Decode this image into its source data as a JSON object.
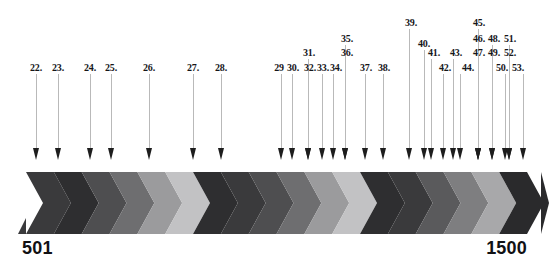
{
  "figure": {
    "width": 549,
    "height": 267,
    "background": "#ffffff"
  },
  "range": {
    "start_label": "501",
    "end_label": "1500"
  },
  "style": {
    "leader_color": "#b9b9b9",
    "arrowhead_color": "#1d1d1d",
    "label_color": "#16161a",
    "range_number_color": "#111114"
  },
  "callouts": [
    {
      "label": "22.",
      "x": 36,
      "label_x": 36,
      "label_y": 62,
      "head_y": 148
    },
    {
      "label": "23.",
      "x": 58,
      "label_x": 58,
      "label_y": 62,
      "head_y": 148
    },
    {
      "label": "24.",
      "x": 90,
      "label_x": 90,
      "label_y": 62,
      "head_y": 148
    },
    {
      "label": "25.",
      "x": 111,
      "label_x": 111,
      "label_y": 62,
      "head_y": 148
    },
    {
      "label": "26.",
      "x": 149,
      "label_x": 149,
      "label_y": 62,
      "head_y": 148
    },
    {
      "label": "27.",
      "x": 193,
      "label_x": 193,
      "label_y": 62,
      "head_y": 148
    },
    {
      "label": "28.",
      "x": 221,
      "label_x": 221,
      "label_y": 62,
      "head_y": 148
    },
    {
      "label": "29",
      "x": 281,
      "label_x": 279,
      "label_y": 62,
      "head_y": 148
    },
    {
      "label": "30.",
      "x": 292,
      "label_x": 293,
      "label_y": 62,
      "head_y": 148
    },
    {
      "label": "31.",
      "x": 308,
      "label_x": 309,
      "label_y": 47,
      "head_y": 148
    },
    {
      "label": "32.",
      "x": 308,
      "label_x": 310,
      "label_y": 62,
      "head_y": 148
    },
    {
      "label": "33.",
      "x": 322,
      "label_x": 323,
      "label_y": 62,
      "head_y": 148
    },
    {
      "label": "34.",
      "x": 333,
      "label_x": 336,
      "label_y": 62,
      "head_y": 148
    },
    {
      "label": "35.",
      "x": 345,
      "label_x": 347,
      "label_y": 33,
      "head_y": 148
    },
    {
      "label": "36.",
      "x": 345,
      "label_x": 347,
      "label_y": 47,
      "head_y": 148
    },
    {
      "label": "37.",
      "x": 365,
      "label_x": 366,
      "label_y": 62,
      "head_y": 148
    },
    {
      "label": "38.",
      "x": 383,
      "label_x": 384,
      "label_y": 62,
      "head_y": 148
    },
    {
      "label": "39.",
      "x": 409,
      "label_x": 411,
      "label_y": 17,
      "head_y": 148
    },
    {
      "label": "40.",
      "x": 424,
      "label_x": 424,
      "label_y": 38,
      "head_y": 148
    },
    {
      "label": "41.",
      "x": 431,
      "label_x": 434,
      "label_y": 47,
      "head_y": 148
    },
    {
      "label": "42.",
      "x": 443,
      "label_x": 445,
      "label_y": 62,
      "head_y": 148
    },
    {
      "label": "43.",
      "x": 453,
      "label_x": 456,
      "label_y": 47,
      "head_y": 148
    },
    {
      "label": "44.",
      "x": 460,
      "label_x": 468,
      "label_y": 62,
      "head_y": 148
    },
    {
      "label": "45.",
      "x": 478,
      "label_x": 479,
      "label_y": 17,
      "head_y": 148
    },
    {
      "label": "46.",
      "x": 478,
      "label_x": 479,
      "label_y": 33,
      "head_y": 148
    },
    {
      "label": "47.",
      "x": 478,
      "label_x": 479,
      "label_y": 47,
      "head_y": 148
    },
    {
      "label": "48.",
      "x": 492,
      "label_x": 494,
      "label_y": 33,
      "head_y": 148
    },
    {
      "label": "49.",
      "x": 492,
      "label_x": 494,
      "label_y": 47,
      "head_y": 148
    },
    {
      "label": "50.",
      "x": 505,
      "label_x": 502,
      "label_y": 62,
      "head_y": 148
    },
    {
      "label": "51.",
      "x": 509,
      "label_x": 510,
      "label_y": 33,
      "head_y": 148
    },
    {
      "label": "52.",
      "x": 509,
      "label_x": 510,
      "label_y": 47,
      "head_y": 148
    },
    {
      "label": "53.",
      "x": 523,
      "label_x": 518,
      "label_y": 62,
      "head_y": 148
    }
  ],
  "chevron_band": {
    "y": 172,
    "height": 62,
    "comment": "repeating dark-to-light chevron gradient cycles, right-pointing",
    "colors": [
      "#3a3a3c",
      "#2e2e30",
      "#4e4e50",
      "#6e6e70",
      "#9b9b9d",
      "#c2c2c4",
      "#2e2e30",
      "#3a3a3c",
      "#4e4e50",
      "#6e6e70",
      "#9b9b9d",
      "#c2c2c4",
      "#2e2e30",
      "#3a3a3c",
      "#5a5a5c",
      "#7e7e80",
      "#a8a8aa",
      "#2a2a2c"
    ]
  }
}
